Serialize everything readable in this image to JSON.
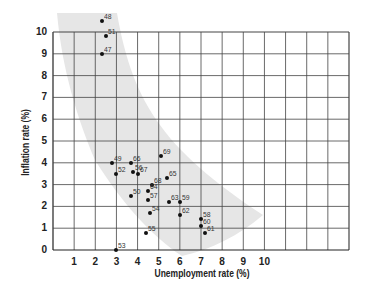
{
  "chart_data": {
    "type": "scatter",
    "title": "",
    "xlabel": "Unemployment rate (%)",
    "ylabel": "Inflation rate (%)",
    "xlim": [
      0,
      14
    ],
    "ylim": [
      0,
      10
    ],
    "x_ticks": [
      "1",
      "2",
      "3",
      "4",
      "5",
      "6",
      "7",
      "8",
      "9",
      "10"
    ],
    "y_ticks": [
      "0",
      "1",
      "2",
      "3",
      "4",
      "5",
      "6",
      "7",
      "8",
      "9",
      "10"
    ],
    "grid": true,
    "legend": null,
    "annotation": "Shaded band showing downward-sloping trade-off (Phillips curve) between unemployment and inflation",
    "band_color": "#e6e6e6",
    "point_color": "#111111",
    "points": [
      {
        "label": "48",
        "x": 2.3,
        "y": 10.5
      },
      {
        "label": "51",
        "x": 2.5,
        "y": 9.8
      },
      {
        "label": "47",
        "x": 2.3,
        "y": 9.0
      },
      {
        "label": "49",
        "x": 2.8,
        "y": 4.0
      },
      {
        "label": "66",
        "x": 3.7,
        "y": 4.0
      },
      {
        "label": "52",
        "x": 3.0,
        "y": 3.5
      },
      {
        "label": "56",
        "x": 3.8,
        "y": 3.6
      },
      {
        "label": "67",
        "x": 4.0,
        "y": 3.5
      },
      {
        "label": "69",
        "x": 5.1,
        "y": 4.3
      },
      {
        "label": "68",
        "x": 4.7,
        "y": 3.0
      },
      {
        "label": "65",
        "x": 5.4,
        "y": 3.3
      },
      {
        "label": "64",
        "x": 4.5,
        "y": 2.7
      },
      {
        "label": "50",
        "x": 3.7,
        "y": 2.5
      },
      {
        "label": "57",
        "x": 4.5,
        "y": 2.3
      },
      {
        "label": "63",
        "x": 5.5,
        "y": 2.2
      },
      {
        "label": "59",
        "x": 6.0,
        "y": 2.2
      },
      {
        "label": "54",
        "x": 4.6,
        "y": 1.7
      },
      {
        "label": "62",
        "x": 6.0,
        "y": 1.6
      },
      {
        "label": "58",
        "x": 7.0,
        "y": 1.4
      },
      {
        "label": "60",
        "x": 7.0,
        "y": 1.1
      },
      {
        "label": "61",
        "x": 7.2,
        "y": 0.8
      },
      {
        "label": "55",
        "x": 4.4,
        "y": 0.8
      },
      {
        "label": "53",
        "x": 3.0,
        "y": 0.0
      }
    ]
  }
}
